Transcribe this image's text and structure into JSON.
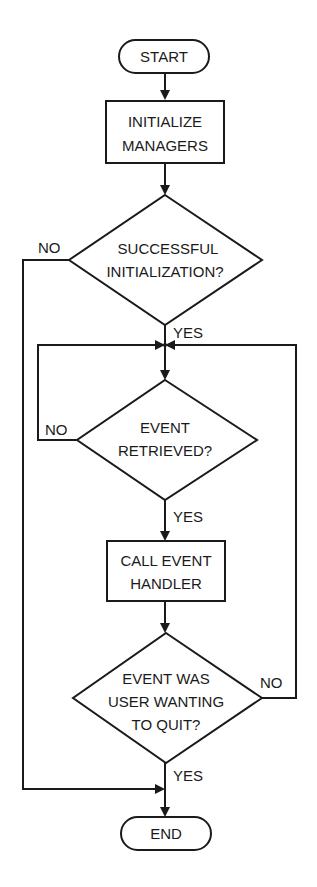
{
  "diagram": {
    "type": "flowchart",
    "nodes": {
      "start": {
        "label": "START",
        "shape": "terminal"
      },
      "init": {
        "line1": "INITIALIZE",
        "line2": "MANAGERS",
        "shape": "process"
      },
      "decision1": {
        "line1": "SUCCESSFUL",
        "line2": "INITIALIZATION?",
        "shape": "decision"
      },
      "decision2": {
        "line1": "EVENT",
        "line2": "RETRIEVED?",
        "shape": "decision"
      },
      "handler": {
        "line1": "CALL EVENT",
        "line2": "HANDLER",
        "shape": "process"
      },
      "decision3": {
        "line1": "EVENT WAS",
        "line2": "USER WANTING",
        "line3": "TO QUIT?",
        "shape": "decision"
      },
      "end": {
        "label": "END",
        "shape": "terminal"
      }
    },
    "edge_labels": {
      "d1_no": "NO",
      "d1_yes": "YES",
      "d2_no": "NO",
      "d2_yes": "YES",
      "d3_no": "NO",
      "d3_yes": "YES"
    },
    "edges": [
      {
        "from": "start",
        "to": "init"
      },
      {
        "from": "init",
        "to": "decision1"
      },
      {
        "from": "decision1",
        "to": "end",
        "label": "NO"
      },
      {
        "from": "decision1",
        "to": "decision2",
        "label": "YES"
      },
      {
        "from": "decision2",
        "to": "decision2",
        "label": "NO"
      },
      {
        "from": "decision2",
        "to": "handler",
        "label": "YES"
      },
      {
        "from": "handler",
        "to": "decision3"
      },
      {
        "from": "decision3",
        "to": "decision2",
        "label": "NO"
      },
      {
        "from": "decision3",
        "to": "end",
        "label": "YES"
      }
    ],
    "colors": {
      "stroke": "#1a1a1a",
      "background": "#ffffff"
    }
  }
}
